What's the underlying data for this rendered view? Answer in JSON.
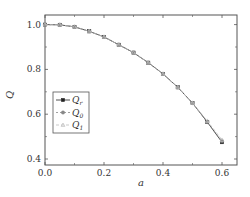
{
  "chart_data": {
    "type": "line",
    "title": "",
    "xlabel": "a",
    "ylabel": "Q",
    "xlim": [
      0.0,
      0.65
    ],
    "ylim": [
      0.4,
      1.05
    ],
    "xticks": [
      "0.0",
      "0.2",
      "0.4",
      "0.6"
    ],
    "yticks": [
      "0.4",
      "0.6",
      "0.8",
      "1.0"
    ],
    "grid": false,
    "legend_position": "lower left",
    "x": [
      0.0,
      0.05,
      0.1,
      0.15,
      0.2,
      0.25,
      0.3,
      0.35,
      0.4,
      0.45,
      0.5,
      0.55,
      0.6
    ],
    "series": [
      {
        "name": "Q_r",
        "label_main": "Q",
        "label_sub": "r",
        "color": "#222222",
        "marker": "square",
        "dash": "none",
        "values": [
          1.0,
          0.999,
          0.99,
          0.97,
          0.945,
          0.91,
          0.875,
          0.83,
          0.78,
          0.72,
          0.65,
          0.565,
          0.475
        ]
      },
      {
        "name": "Q_0",
        "label_main": "Q",
        "label_sub": "0",
        "color": "#888888",
        "marker": "circle",
        "dash": "2,2",
        "values": [
          1.0,
          0.999,
          0.99,
          0.97,
          0.945,
          0.91,
          0.875,
          0.83,
          0.78,
          0.72,
          0.65,
          0.565,
          0.48
        ]
      },
      {
        "name": "Q_1",
        "label_main": "Q",
        "label_sub": "1",
        "color": "#bbbbbb",
        "marker": "triangle",
        "dash": "3,2",
        "values": [
          1.0,
          0.999,
          0.99,
          0.97,
          0.945,
          0.91,
          0.875,
          0.83,
          0.78,
          0.72,
          0.65,
          0.57,
          0.485
        ]
      }
    ]
  }
}
